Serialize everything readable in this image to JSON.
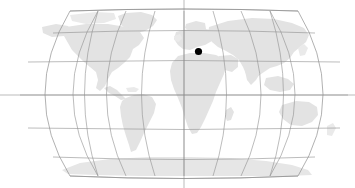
{
  "figure": {
    "name": "world-locator-map",
    "type": "map",
    "projection": "robinson",
    "width": 355,
    "height": 188,
    "background_color": "#ffffff"
  },
  "colors": {
    "land": "#e3e3e3",
    "land_light": "#eaeaea",
    "graticule": "#8f8f8f",
    "outline": "#8f8f8f",
    "marker": "#000000",
    "background": "#ffffff"
  },
  "map_frame": {
    "center_x": 184,
    "center_y": 95,
    "left_x": 20,
    "right_x": 348,
    "top_y": 11,
    "bottom_y": 176,
    "half_width": 164,
    "half_height": 82.5
  },
  "graticule": {
    "meridian_step_degrees": 30,
    "parallel_step_degrees": 30,
    "meridians_degrees": [
      -180,
      -150,
      -120,
      -90,
      -60,
      -30,
      0,
      30,
      60,
      90,
      120,
      150,
      180
    ],
    "parallels_degrees": [
      75,
      60,
      30,
      0,
      -30,
      -60,
      -75
    ],
    "equator_degrees": 0,
    "central_meridian_degrees": 0,
    "grid_visible": true
  },
  "axis_extensions": {
    "horizontal_y": 95,
    "horizontal_from_x": 0,
    "horizontal_to_x": 355,
    "vertical_x": 184,
    "vertical_from_y": 0,
    "vertical_to_y": 188,
    "description": "equator and central meridian drawn past the map frame to the image edges"
  },
  "marker": {
    "label": "location-marker",
    "x": 198.5,
    "y": 51.5,
    "radius": 3.6,
    "color": "#000000",
    "region": "Mediterranean / southern Europe"
  },
  "landmasses": [
    {
      "name": "north-america"
    },
    {
      "name": "south-america"
    },
    {
      "name": "greenland"
    },
    {
      "name": "europe"
    },
    {
      "name": "africa"
    },
    {
      "name": "asia"
    },
    {
      "name": "australia"
    },
    {
      "name": "antarctica"
    },
    {
      "name": "madagascar"
    },
    {
      "name": "new-zealand"
    },
    {
      "name": "japan"
    },
    {
      "name": "indonesia"
    },
    {
      "name": "british-isles"
    }
  ],
  "chart_data": {
    "type": "map",
    "title": "",
    "projection": "Robinson",
    "grid": true,
    "xlim": [
      -180,
      180
    ],
    "ylim": [
      -90,
      90
    ],
    "points": [
      {
        "label": "marker",
        "lon": 17.5,
        "lat": 38.5,
        "pixel_x": 198.5,
        "pixel_y": 51.5
      }
    ]
  }
}
